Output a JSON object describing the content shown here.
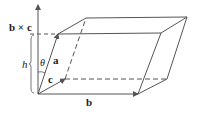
{
  "diagram": {
    "type": "parallelepiped-volume",
    "labels": {
      "cross_product": "b × c",
      "height": "h",
      "angle": "θ",
      "vec_a": "a",
      "vec_b": "b",
      "vec_c": "c"
    },
    "colors": {
      "stroke": "#555555",
      "text": "#222222",
      "background": "#ffffff"
    },
    "vertices": {
      "origin": [
        38,
        94
      ],
      "b_end": [
        138,
        94
      ],
      "c_end": [
        65,
        79
      ],
      "bc_end": [
        167,
        79
      ],
      "a_end": [
        58,
        34
      ],
      "ab_end": [
        161,
        33
      ],
      "ac_end": [
        86,
        18
      ],
      "abc_end": [
        187,
        17
      ],
      "normal_tip": [
        38,
        4
      ]
    }
  }
}
